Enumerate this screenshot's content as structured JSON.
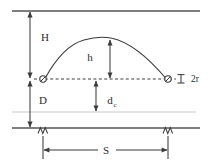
{
  "diagram": {
    "colors": {
      "line_dark": "#3c3c3c",
      "line_mid": "#555555",
      "line_light": "#b9b9b9",
      "text": "#2b2b2b",
      "background": "#ffffff"
    },
    "labels": {
      "total_height": "H",
      "sag": "h",
      "ground_clearance": "D",
      "mid_clearance_base": "d",
      "mid_clearance_sub": "c",
      "span": "S",
      "cable_diameter": "2r"
    },
    "geometry": {
      "top_line_y": 11,
      "support_line_y": 79,
      "faint_line_y": 112,
      "ground_line_y": 128,
      "left_support_x": 43,
      "right_support_x": 168,
      "apex_x": 108,
      "apex_y": 38,
      "dim_line_x": 30,
      "span_dim_y": 150
    }
  }
}
